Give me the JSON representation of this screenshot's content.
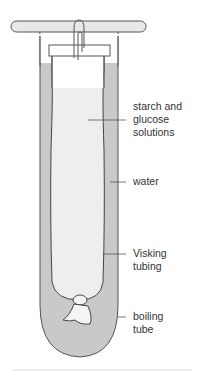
{
  "diagram": {
    "labels": [
      {
        "id": "starch-glucose",
        "text": "starch and\nglucose\nsolutions"
      },
      {
        "id": "water",
        "text": "water"
      },
      {
        "id": "visking",
        "text": "Visking\ntubing"
      },
      {
        "id": "boiling-tube",
        "text": "boiling\ntube"
      }
    ],
    "colors": {
      "water": "#c8c8c8",
      "solution": "#ececec",
      "outline": "#555555",
      "leader": "#555555"
    }
  }
}
